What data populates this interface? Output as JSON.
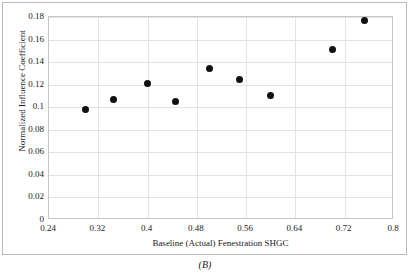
{
  "caption": "(B)",
  "chart_data": {
    "type": "scatter",
    "title": "",
    "xlabel": "Baseline (Actual) Fenestration SHGC",
    "ylabel": "Normalized Influence Coefficient",
    "xlim": [
      0.24,
      0.8
    ],
    "ylim": [
      0,
      0.18
    ],
    "xticks": [
      "0.24",
      "0.32",
      "0.4",
      "0.48",
      "0.56",
      "0.64",
      "0.72",
      "0.8"
    ],
    "xtick_values": [
      0.24,
      0.32,
      0.4,
      0.48,
      0.56,
      0.64,
      0.72,
      0.8
    ],
    "yticks": [
      "0",
      "0.02",
      "0.04",
      "0.06",
      "0.08",
      "0.1",
      "0.12",
      "0.14",
      "0.16",
      "0.18"
    ],
    "ytick_values": [
      0,
      0.02,
      0.04,
      0.06,
      0.08,
      0.1,
      0.12,
      0.14,
      0.16,
      0.18
    ],
    "grid": true,
    "legend": false,
    "marker": "filled-circle",
    "marker_color": "#111111",
    "x": [
      0.3,
      0.345,
      0.4,
      0.445,
      0.5,
      0.55,
      0.6,
      0.7,
      0.752
    ],
    "y": [
      0.098,
      0.107,
      0.121,
      0.105,
      0.134,
      0.125,
      0.11,
      0.151,
      0.177
    ],
    "points": [
      {
        "x": 0.3,
        "y": 0.098
      },
      {
        "x": 0.345,
        "y": 0.107
      },
      {
        "x": 0.4,
        "y": 0.121
      },
      {
        "x": 0.445,
        "y": 0.105
      },
      {
        "x": 0.5,
        "y": 0.134
      },
      {
        "x": 0.55,
        "y": 0.125
      },
      {
        "x": 0.6,
        "y": 0.11
      },
      {
        "x": 0.7,
        "y": 0.151
      },
      {
        "x": 0.752,
        "y": 0.177
      }
    ]
  }
}
